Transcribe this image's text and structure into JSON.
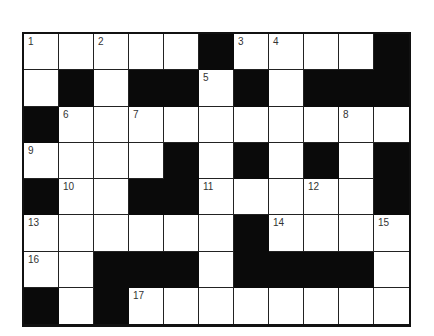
{
  "puzzle": {
    "rows": 8,
    "cols": 11,
    "grid": [
      [
        "W",
        "W",
        "W",
        "W",
        "W",
        "B",
        "W",
        "W",
        "W",
        "W",
        "B"
      ],
      [
        "W",
        "B",
        "W",
        "B",
        "B",
        "W",
        "B",
        "W",
        "B",
        "B",
        "B"
      ],
      [
        "B",
        "W",
        "W",
        "W",
        "W",
        "W",
        "W",
        "W",
        "W",
        "W",
        "W"
      ],
      [
        "W",
        "W",
        "W",
        "W",
        "B",
        "W",
        "B",
        "W",
        "B",
        "W",
        "B"
      ],
      [
        "B",
        "W",
        "W",
        "B",
        "B",
        "W",
        "W",
        "W",
        "W",
        "W",
        "B"
      ],
      [
        "W",
        "W",
        "W",
        "W",
        "W",
        "W",
        "B",
        "W",
        "W",
        "W",
        "W"
      ],
      [
        "W",
        "W",
        "B",
        "B",
        "B",
        "W",
        "B",
        "B",
        "B",
        "B",
        "W"
      ],
      [
        "B",
        "W",
        "B",
        "W",
        "W",
        "W",
        "W",
        "W",
        "W",
        "W",
        "W"
      ]
    ],
    "numbers": [
      {
        "row": 0,
        "col": 0,
        "n": "1"
      },
      {
        "row": 0,
        "col": 2,
        "n": "2"
      },
      {
        "row": 0,
        "col": 6,
        "n": "3"
      },
      {
        "row": 0,
        "col": 7,
        "n": "4"
      },
      {
        "row": 1,
        "col": 5,
        "n": "5"
      },
      {
        "row": 2,
        "col": 1,
        "n": "6"
      },
      {
        "row": 2,
        "col": 3,
        "n": "7"
      },
      {
        "row": 2,
        "col": 9,
        "n": "8"
      },
      {
        "row": 3,
        "col": 0,
        "n": "9"
      },
      {
        "row": 4,
        "col": 1,
        "n": "10"
      },
      {
        "row": 4,
        "col": 5,
        "n": "11"
      },
      {
        "row": 4,
        "col": 8,
        "n": "12"
      },
      {
        "row": 5,
        "col": 0,
        "n": "13"
      },
      {
        "row": 5,
        "col": 7,
        "n": "14"
      },
      {
        "row": 5,
        "col": 10,
        "n": "15"
      },
      {
        "row": 6,
        "col": 0,
        "n": "16"
      },
      {
        "row": 7,
        "col": 3,
        "n": "17"
      }
    ],
    "colors": {
      "block": "#0a0a0a",
      "cell": "#ffffff",
      "grid_line": "#222222",
      "number_text": "#333333"
    }
  }
}
